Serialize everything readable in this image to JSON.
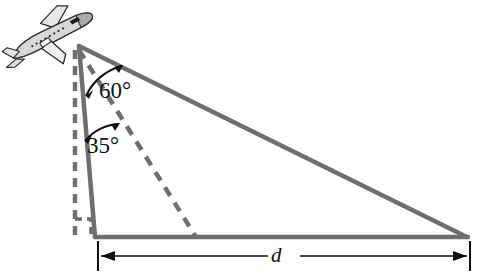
{
  "figure": {
    "type": "geometry-diagram",
    "labels": {
      "angle_upper": "60°",
      "angle_lower": "35°",
      "distance": "d"
    },
    "icons": {
      "airplane": "airplane-icon",
      "right_angle": "right-angle-marker-icon",
      "arc_upper": "angle-arc-double-arrow-icon",
      "arc_lower": "angle-arc-double-arrow-icon",
      "dimension_arrow": "double-headed-dimension-arrow-icon"
    },
    "colors": {
      "line_gray": "#6f6f6f",
      "ink_black": "#111111",
      "background": "#ffffff",
      "plane_body": "#d8d8d8",
      "plane_outline": "#2a2a2a"
    },
    "geometry": {
      "apex": [
        79,
        46
      ],
      "base_left": [
        95,
        237
      ],
      "base_right": [
        467,
        237
      ],
      "vertical_dashed_top": [
        75,
        52
      ],
      "vertical_dashed_bottom": [
        75,
        237
      ],
      "dashed_ray_end": [
        196,
        237
      ],
      "dimension_y": 256,
      "dimension_left_x": 98,
      "dimension_right_x": 470
    },
    "elements": {
      "hypotenuse": "solid gray line from apex to base right",
      "altitude": "solid gray near-vertical line from apex to base left",
      "ground": "solid gray horizontal base line",
      "vertical_reference": "dashed gray vertical line",
      "sight_line_35": "dashed gray ray from apex to ground"
    }
  }
}
